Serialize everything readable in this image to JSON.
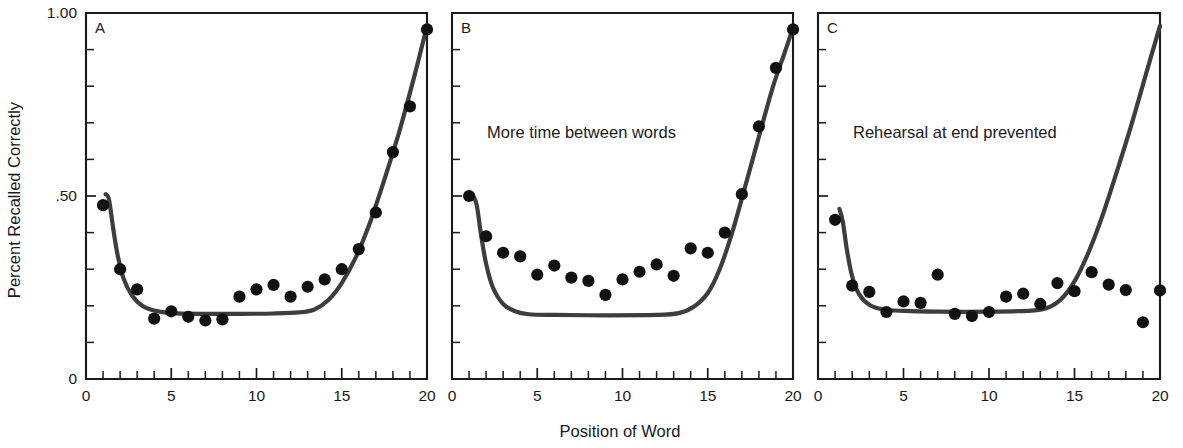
{
  "figure": {
    "ylabel": "Percent Recalled Correctly",
    "xlabel": "Position of Word",
    "ytick_labels": [
      "1.00",
      ".50",
      "0"
    ],
    "xtick_labels": [
      "0",
      "5",
      "10",
      "15",
      "20"
    ]
  },
  "panels": [
    {
      "letter": "A",
      "caption": "",
      "ytick_labels": [
        "1.00",
        ".50",
        "0"
      ],
      "xtick_labels": [
        "0",
        "5",
        "10",
        "15",
        "20"
      ]
    },
    {
      "letter": "B",
      "caption": "More time between words",
      "ytick_labels": [
        "",
        "",
        ""
      ],
      "xtick_labels": [
        "0",
        "5",
        "10",
        "15",
        "20"
      ]
    },
    {
      "letter": "C",
      "caption": "Rehearsal at end prevented",
      "ytick_labels": [
        "",
        "",
        ""
      ],
      "xtick_labels": [
        "0",
        "5",
        "10",
        "15",
        "20"
      ]
    }
  ],
  "chart_data": {
    "type": "scatter",
    "title": "",
    "xlabel": "Position of Word",
    "ylabel": "Percent Recalled Correctly",
    "xlim": [
      0,
      20
    ],
    "ylim": [
      0,
      1.0
    ],
    "xticks": [
      0,
      5,
      10,
      15,
      20
    ],
    "xticks_minor_step": 1,
    "yticks": [
      0,
      0.5,
      1.0
    ],
    "yticks_minor_step": 0.1,
    "ytick_text": [
      "0",
      ".50",
      "1.00"
    ],
    "grid": false,
    "legend": null,
    "panels": [
      {
        "label": "A",
        "annotation": "",
        "x": [
          1,
          2,
          3,
          4,
          5,
          6,
          7,
          8,
          9,
          10,
          11,
          12,
          13,
          14,
          15,
          16,
          17,
          18,
          19,
          20
        ],
        "values": [
          0.475,
          0.3,
          0.245,
          0.165,
          0.185,
          0.17,
          0.16,
          0.163,
          0.225,
          0.245,
          0.257,
          0.225,
          0.252,
          0.272,
          0.3,
          0.355,
          0.455,
          0.62,
          0.745,
          0.955
        ],
        "fit_curve": [
          [
            1.15,
            0.505
          ],
          [
            1.35,
            0.49
          ],
          [
            1.6,
            0.41
          ],
          [
            1.85,
            0.34
          ],
          [
            2.2,
            0.275
          ],
          [
            2.7,
            0.228
          ],
          [
            3.3,
            0.2
          ],
          [
            4.0,
            0.187
          ],
          [
            5.0,
            0.18
          ],
          [
            7.0,
            0.178
          ],
          [
            9.0,
            0.178
          ],
          [
            11.0,
            0.179
          ],
          [
            12.5,
            0.182
          ],
          [
            13.4,
            0.19
          ],
          [
            14.2,
            0.215
          ],
          [
            15.0,
            0.262
          ],
          [
            15.8,
            0.33
          ],
          [
            16.6,
            0.42
          ],
          [
            17.5,
            0.545
          ],
          [
            18.4,
            0.68
          ],
          [
            19.3,
            0.835
          ],
          [
            20.0,
            0.965
          ]
        ]
      },
      {
        "label": "B",
        "annotation": "More time between words",
        "x": [
          1,
          2,
          3,
          4,
          5,
          6,
          7,
          8,
          9,
          10,
          11,
          12,
          13,
          14,
          15,
          16,
          17,
          18,
          19,
          20
        ],
        "values": [
          0.5,
          0.39,
          0.345,
          0.335,
          0.285,
          0.31,
          0.277,
          0.268,
          0.23,
          0.272,
          0.293,
          0.313,
          0.282,
          0.357,
          0.345,
          0.4,
          0.505,
          0.69,
          0.85,
          0.955
        ],
        "fit_curve": [
          [
            1.2,
            0.505
          ],
          [
            1.45,
            0.475
          ],
          [
            1.7,
            0.395
          ],
          [
            2.0,
            0.315
          ],
          [
            2.4,
            0.25
          ],
          [
            3.0,
            0.205
          ],
          [
            3.7,
            0.185
          ],
          [
            4.5,
            0.177
          ],
          [
            6.0,
            0.175
          ],
          [
            9.0,
            0.174
          ],
          [
            12.0,
            0.175
          ],
          [
            13.3,
            0.18
          ],
          [
            14.2,
            0.198
          ],
          [
            15.0,
            0.235
          ],
          [
            15.7,
            0.3
          ],
          [
            16.4,
            0.395
          ],
          [
            17.1,
            0.51
          ],
          [
            17.9,
            0.645
          ],
          [
            18.8,
            0.795
          ],
          [
            19.5,
            0.89
          ],
          [
            20.0,
            0.96
          ]
        ]
      },
      {
        "label": "C",
        "annotation": "Rehearsal at end prevented",
        "x": [
          1,
          2,
          3,
          4,
          5,
          6,
          7,
          8,
          9,
          10,
          11,
          12,
          13,
          14,
          15,
          16,
          17,
          18,
          19,
          20
        ],
        "values": [
          0.435,
          0.255,
          0.238,
          0.183,
          0.212,
          0.208,
          0.285,
          0.178,
          0.172,
          0.183,
          0.225,
          0.233,
          0.205,
          0.262,
          0.24,
          0.292,
          0.258,
          0.243,
          0.155,
          0.242
        ],
        "fit_curve": [
          [
            1.25,
            0.465
          ],
          [
            1.45,
            0.43
          ],
          [
            1.7,
            0.35
          ],
          [
            2.0,
            0.28
          ],
          [
            2.4,
            0.232
          ],
          [
            3.0,
            0.203
          ],
          [
            3.8,
            0.19
          ],
          [
            5.0,
            0.186
          ],
          [
            7.0,
            0.184
          ],
          [
            10.0,
            0.184
          ],
          [
            12.5,
            0.187
          ],
          [
            13.5,
            0.196
          ],
          [
            14.3,
            0.222
          ],
          [
            15.1,
            0.275
          ],
          [
            15.9,
            0.355
          ],
          [
            16.7,
            0.455
          ],
          [
            17.5,
            0.57
          ],
          [
            18.3,
            0.69
          ],
          [
            19.1,
            0.82
          ],
          [
            20.0,
            0.965
          ]
        ]
      }
    ]
  }
}
